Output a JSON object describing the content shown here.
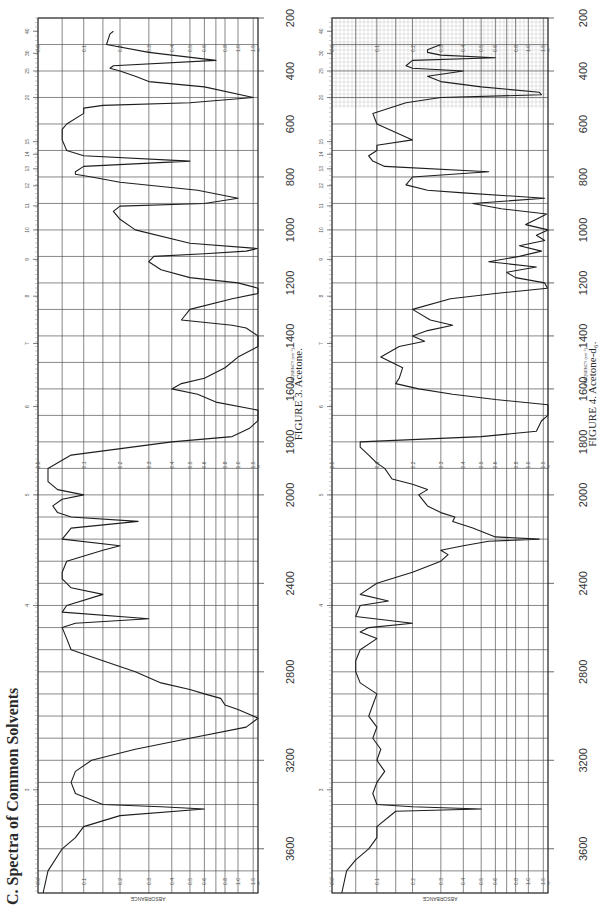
{
  "page": {
    "section_title": "C. Spectra of Common Solvents",
    "orientation": "rotated 90° counter-clockwise (landscape on portrait page)"
  },
  "chart_data": [
    {
      "type": "line",
      "title": "FIGURE 3.   Acetone.",
      "xlabel": "FREQUENCY (cm-1)",
      "ylabel": "ABSORBANCE",
      "x_ticks": [
        3600,
        3200,
        2800,
        2400,
        2000,
        1800,
        1600,
        1400,
        1200,
        1000,
        800,
        600,
        400,
        200
      ],
      "wavelength_ticks_um": [
        3,
        4,
        5,
        6,
        7,
        8,
        9,
        10,
        11,
        12,
        13,
        14,
        15,
        20,
        25,
        30,
        40
      ],
      "y_ticks": [
        0.0,
        0.1,
        0.2,
        0.3,
        0.4,
        0.5,
        0.6,
        0.8,
        1.0,
        1.5,
        "∞"
      ],
      "xlim": [
        3800,
        200
      ],
      "ylim": [
        0.0,
        2.0
      ],
      "grid": true,
      "series": [
        {
          "name": "Acetone",
          "x": [
            3800,
            3700,
            3600,
            3550,
            3500,
            3450,
            3420,
            3410,
            3400,
            3350,
            3300,
            3250,
            3200,
            3150,
            3100,
            3050,
            3010,
            3000,
            2970,
            2950,
            2920,
            2900,
            2880,
            2850,
            2800,
            2750,
            2700,
            2650,
            2600,
            2580,
            2560,
            2530,
            2500,
            2450,
            2420,
            2400,
            2380,
            2350,
            2300,
            2250,
            2230,
            2200,
            2150,
            2120,
            2100,
            2080,
            2050,
            2020,
            2000,
            1980,
            1950,
            1900,
            1850,
            1800,
            1780,
            1750,
            1720,
            1700,
            1680,
            1650,
            1620,
            1600,
            1580,
            1560,
            1520,
            1480,
            1440,
            1420,
            1400,
            1370,
            1360,
            1340,
            1300,
            1260,
            1240,
            1220,
            1200,
            1180,
            1150,
            1120,
            1100,
            1090,
            1080,
            1070,
            1050,
            1000,
            960,
            930,
            910,
            900,
            880,
            850,
            820,
            800,
            790,
            780,
            760,
            740,
            720,
            700,
            660,
            620,
            600,
            560,
            540,
            530,
            520,
            500,
            460,
            440,
            420,
            400,
            390,
            380,
            360,
            330,
            300,
            260,
            250
          ],
          "absorbance": [
            0.01,
            0.02,
            0.05,
            0.08,
            0.1,
            0.2,
            0.6,
            0.35,
            0.15,
            0.08,
            0.07,
            0.08,
            0.12,
            0.25,
            0.5,
            1.2,
            2.0,
            1.5,
            1.0,
            0.8,
            0.75,
            0.6,
            0.5,
            0.35,
            0.25,
            0.15,
            0.07,
            0.06,
            0.05,
            0.08,
            0.3,
            0.05,
            0.06,
            0.15,
            0.07,
            0.06,
            0.05,
            0.05,
            0.06,
            0.15,
            0.2,
            0.05,
            0.07,
            0.26,
            0.07,
            0.04,
            0.03,
            0.05,
            0.1,
            0.04,
            0.02,
            0.02,
            0.07,
            0.4,
            0.9,
            1.3,
            2.0,
            2.0,
            2.0,
            0.7,
            0.55,
            0.4,
            0.45,
            0.6,
            0.8,
            1.0,
            2.0,
            2.0,
            2.0,
            1.2,
            0.9,
            0.45,
            0.5,
            0.9,
            2.0,
            2.0,
            1.0,
            0.5,
            0.35,
            0.3,
            0.32,
            0.6,
            1.2,
            1.9,
            0.5,
            0.25,
            0.2,
            0.18,
            0.2,
            0.6,
            1.0,
            0.55,
            0.2,
            0.12,
            0.08,
            0.08,
            0.1,
            0.5,
            0.1,
            0.06,
            0.05,
            0.05,
            0.06,
            0.1,
            0.1,
            0.15,
            0.5,
            1.5,
            0.6,
            0.3,
            0.25,
            0.2,
            0.17,
            0.18,
            0.7,
            0.3,
            0.16,
            0.17,
            0.18,
            0.2,
            0.25
          ]
        }
      ],
      "peaks_strong": [
        {
          "x": 3005,
          "label": "C–H stretch"
        },
        {
          "x": 1715,
          "label": "C=O stretch"
        },
        {
          "x": 1420
        },
        {
          "x": 1360
        },
        {
          "x": 1220
        },
        {
          "x": 1092
        },
        {
          "x": 900
        },
        {
          "x": 530
        }
      ]
    },
    {
      "type": "line",
      "title": "FIGURE 4.   Acetone-d6.",
      "xlabel": "FREQUENCY (cm-1)",
      "ylabel": "ABSORBANCE",
      "x_ticks": [
        3600,
        3200,
        2800,
        2400,
        2000,
        1800,
        1600,
        1400,
        1200,
        1000,
        800,
        600,
        400,
        200
      ],
      "wavelength_ticks_um": [
        3,
        4,
        5,
        6,
        7,
        8,
        9,
        10,
        11,
        12,
        13,
        14,
        15,
        20,
        25,
        30,
        40
      ],
      "y_ticks": [
        0.0,
        0.1,
        0.2,
        0.3,
        0.4,
        0.5,
        0.6,
        0.8,
        1.0,
        1.5,
        "∞"
      ],
      "xlim": [
        3800,
        200
      ],
      "ylim": [
        0.0,
        2.0
      ],
      "grid": true,
      "series": [
        {
          "name": "Acetone-d6",
          "x": [
            3800,
            3700,
            3650,
            3600,
            3550,
            3500,
            3430,
            3420,
            3410,
            3400,
            3350,
            3300,
            3250,
            3200,
            3150,
            3100,
            3050,
            3000,
            2950,
            2900,
            2850,
            2800,
            2750,
            2700,
            2650,
            2620,
            2600,
            2580,
            2550,
            2500,
            2480,
            2450,
            2400,
            2350,
            2300,
            2270,
            2250,
            2230,
            2210,
            2200,
            2190,
            2150,
            2120,
            2100,
            2080,
            2050,
            2000,
            1980,
            1960,
            1940,
            1900,
            1880,
            1850,
            1820,
            1800,
            1780,
            1760,
            1720,
            1700,
            1680,
            1660,
            1640,
            1620,
            1600,
            1580,
            1560,
            1520,
            1480,
            1440,
            1420,
            1400,
            1380,
            1360,
            1340,
            1300,
            1260,
            1240,
            1220,
            1200,
            1180,
            1160,
            1140,
            1120,
            1100,
            1080,
            1060,
            1040,
            1020,
            1000,
            980,
            960,
            940,
            920,
            900,
            880,
            860,
            850,
            830,
            800,
            780,
            760,
            740,
            720,
            700,
            690,
            680,
            660,
            600,
            560,
            520,
            500,
            490,
            480,
            460,
            440,
            420,
            400,
            390,
            380,
            360,
            350,
            340,
            330,
            320,
            300,
            260,
            250
          ],
          "absorbance": [
            0.02,
            0.03,
            0.05,
            0.08,
            0.1,
            0.1,
            0.15,
            0.5,
            0.2,
            0.1,
            0.09,
            0.1,
            0.12,
            0.1,
            0.11,
            0.09,
            0.1,
            0.08,
            0.09,
            0.1,
            0.06,
            0.05,
            0.05,
            0.06,
            0.1,
            0.06,
            0.08,
            0.2,
            0.05,
            0.06,
            0.13,
            0.06,
            0.1,
            0.2,
            0.3,
            0.33,
            0.3,
            0.4,
            0.55,
            1.3,
            0.6,
            0.45,
            0.35,
            0.36,
            0.3,
            0.25,
            0.22,
            0.25,
            0.2,
            0.14,
            0.12,
            0.1,
            0.08,
            0.06,
            0.06,
            0.5,
            1.2,
            1.4,
            2.0,
            2.0,
            2.0,
            0.6,
            0.35,
            0.22,
            0.15,
            0.16,
            0.17,
            0.11,
            0.16,
            0.24,
            0.2,
            0.25,
            0.35,
            0.26,
            0.2,
            0.34,
            0.6,
            1.9,
            1.6,
            0.8,
            0.7,
            1.2,
            0.55,
            0.85,
            1.4,
            0.85,
            1.6,
            1.2,
            2.0,
            0.95,
            1.2,
            1.8,
            0.65,
            0.45,
            1.6,
            0.4,
            0.25,
            0.18,
            0.2,
            0.55,
            0.12,
            0.09,
            0.08,
            0.1,
            0.1,
            0.1,
            0.2,
            0.1,
            0.09,
            0.18,
            0.3,
            1.4,
            1.3,
            0.5,
            0.3,
            0.25,
            0.4,
            0.2,
            0.18,
            0.2,
            0.6,
            0.3,
            0.25,
            0.25,
            0.3
          ]
        }
      ],
      "peaks_strong": [
        {
          "x": 2220,
          "label": "C–D stretch"
        },
        {
          "x": 1700,
          "label": "C=O stretch"
        },
        {
          "x": 1250
        },
        {
          "x": 1030
        },
        {
          "x": 890
        },
        {
          "x": 480
        }
      ]
    }
  ],
  "figures": [
    {
      "id": "fig3",
      "caption": "FIGURE 3.   Acetone.",
      "freq_label": "FREQUENCY (cm⁻¹)",
      "axis_title": "ABSORBANCE"
    },
    {
      "id": "fig4",
      "caption": "FIGURE 4.   Acetone-d₆.",
      "freq_label": "FREQUENCY (cm⁻¹)",
      "axis_title": "ABSORBANCE"
    }
  ],
  "axes": {
    "freq_ticks": [
      3600,
      3200,
      2800,
      2400,
      2000,
      1800,
      1600,
      1400,
      1200,
      1000,
      800,
      600,
      400,
      200
    ],
    "abs_ticks": [
      "0.0",
      "0.1",
      "0.2",
      "0.3",
      "0.4",
      "0.5",
      "0.6",
      "0.8",
      "1.0",
      "1.5",
      "∞"
    ],
    "micron_ticks": [
      "3",
      "4",
      "5",
      "6",
      "7",
      "8",
      "9",
      "10",
      "11",
      "12",
      "13",
      "14",
      "15",
      "20",
      "25",
      "30",
      "40"
    ]
  },
  "colors": {
    "ink": "#2a2a2a",
    "grid": "#555555",
    "grid_minor": "#bdbdbd",
    "paper": "#ffffff"
  }
}
